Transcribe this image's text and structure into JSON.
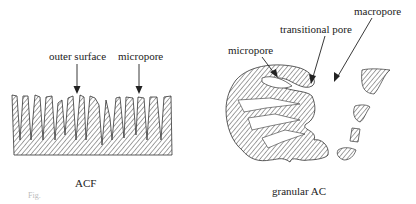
{
  "left_diagram": {
    "caption": "ACF",
    "labels": {
      "outer_surface": "outer surface",
      "micropore": "micropore"
    }
  },
  "right_diagram": {
    "caption": "granular AC",
    "labels": {
      "micropore": "micropore",
      "transitional_pore": "transitional pore",
      "macropore": "macropore"
    }
  },
  "figure_caption_fragment": "Fig."
}
